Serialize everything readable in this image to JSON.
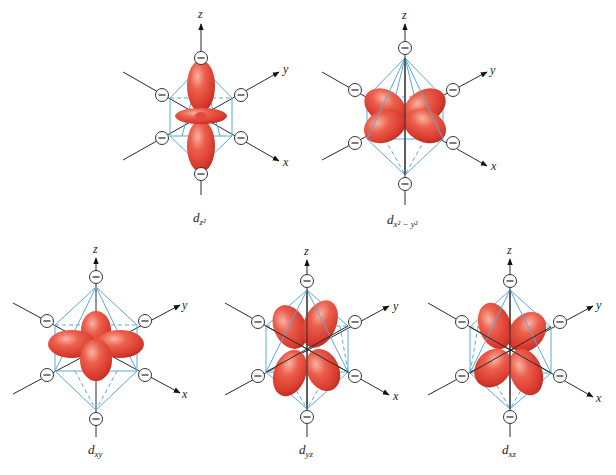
{
  "figure": {
    "colors": {
      "lobe": "#e5483a",
      "lobe_highlight": "#f6a594",
      "lobe_shadow": "#b82a22",
      "octahedron": "#5aa9d6",
      "axis": "#2a2a2a"
    },
    "axes": {
      "z": "z",
      "y": "y",
      "x": "x"
    },
    "charge_symbol": "−",
    "panels": [
      {
        "id": "dz2",
        "label_main": "d",
        "label_sub": "z²",
        "cx": 201,
        "cy": 116
      },
      {
        "id": "dx2y2",
        "label_main": "d",
        "label_sub": "x² − y²",
        "cx": 405,
        "cy": 116
      },
      {
        "id": "dxy",
        "label_main": "d",
        "label_sub": "xy",
        "cx": 96,
        "cy": 348
      },
      {
        "id": "dyz",
        "label_main": "d",
        "label_sub": "yz",
        "cx": 307,
        "cy": 349
      },
      {
        "id": "dxz",
        "label_main": "d",
        "label_sub": "xz",
        "cx": 510,
        "cy": 349
      }
    ]
  }
}
